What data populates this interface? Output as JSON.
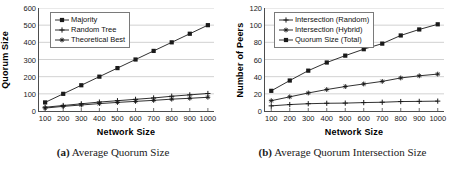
{
  "figure": {
    "background": "#ffffff",
    "axis_color": "#4d4d4d",
    "grid_color": "#bfbfbf",
    "series_color": "#1a1a1a"
  },
  "subfigures": [
    {
      "caption_tag": "(a)",
      "caption_text": "Average Quorum Size",
      "chart_data": {
        "type": "line",
        "title": "",
        "xlabel": "Network Size",
        "ylabel": "Quorum Size",
        "x": [
          100,
          200,
          300,
          400,
          500,
          600,
          700,
          800,
          900,
          1000
        ],
        "xticklabels": [
          "100",
          "200",
          "300",
          "400",
          "500",
          "600",
          "700",
          "800",
          "900",
          "1000"
        ],
        "yticks": [
          0,
          100,
          200,
          300,
          400,
          500,
          600
        ],
        "yticklabels": [
          "0",
          "100",
          "200",
          "300",
          "400",
          "500",
          "600"
        ],
        "ylim": [
          0,
          600
        ],
        "grid": "horizontal",
        "legend_position": "upper-left",
        "series": [
          {
            "name": "Majority",
            "marker": "filled-square",
            "values": [
              50,
              100,
              150,
              200,
              250,
              300,
              350,
              400,
              450,
              500
            ]
          },
          {
            "name": "Random Tree",
            "marker": "plus",
            "values": [
              22,
              32,
              42,
              52,
              60,
              68,
              76,
              86,
              94,
              102
            ]
          },
          {
            "name": "Theoretical Best",
            "marker": "asterisk",
            "values": [
              17,
              27,
              35,
              43,
              50,
              56,
              62,
              69,
              74,
              80
            ]
          }
        ]
      }
    },
    {
      "caption_tag": "(b)",
      "caption_text": "Average Quorum Intersection Size",
      "chart_data": {
        "type": "line",
        "title": "",
        "xlabel": "Network Size",
        "ylabel": "Number of Peers",
        "x": [
          100,
          200,
          300,
          400,
          500,
          600,
          700,
          800,
          900,
          1000
        ],
        "xticklabels": [
          "100",
          "200",
          "300",
          "400",
          "500",
          "600",
          "700",
          "800",
          "900",
          "1000"
        ],
        "yticks": [
          0,
          20,
          40,
          60,
          80,
          100,
          120
        ],
        "yticklabels": [
          "0",
          "20",
          "40",
          "60",
          "80",
          "100",
          "120"
        ],
        "ylim": [
          0,
          120
        ],
        "grid": "horizontal",
        "legend_position": "upper-left",
        "series": [
          {
            "name": "Intersection (Random)",
            "marker": "plus",
            "values": [
              6,
              7.5,
              8.5,
              9,
              9.2,
              9.8,
              10.2,
              11,
              11.2,
              11.5
            ]
          },
          {
            "name": "Intersection (Hybrid)",
            "marker": "asterisk",
            "values": [
              12,
              16.5,
              21,
              25,
              28.5,
              31.5,
              34.5,
              38.5,
              41,
              43
            ]
          },
          {
            "name": "Quorum Size (Total)",
            "marker": "filled-square",
            "values": [
              23.5,
              35.5,
              47,
              56.5,
              64.5,
              72,
              78.5,
              88,
              95,
              101
            ]
          }
        ]
      }
    }
  ]
}
